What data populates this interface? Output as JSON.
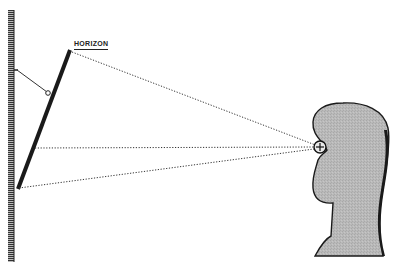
{
  "diagram": {
    "type": "optical-sightline-diagram",
    "labels": {
      "horizon": "HORIZON"
    },
    "elements": {
      "wall": {
        "description": "hatched vertical wall on left"
      },
      "mirror": {
        "description": "thick tilted mirror leaning against wall"
      },
      "support_rod": {
        "description": "thin rod from wall to mirror with pivot circle"
      },
      "sightlines": [
        "to mirror top (horizon)",
        "horizontal to mirror middle",
        "to mirror bottom"
      ],
      "observer": {
        "description": "gray head silhouette in profile facing left"
      },
      "eye": {
        "description": "circle with plus sign marking the eye"
      }
    },
    "colors": {
      "ink": "#1a1a1a",
      "head_fill": "#b8b8b8",
      "background": "#ffffff"
    }
  }
}
